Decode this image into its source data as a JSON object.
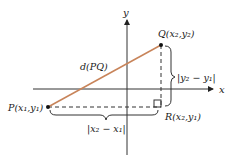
{
  "diagram": {
    "colors": {
      "segment": "#c8845a",
      "axes": "#222222",
      "background": "#ffffff"
    },
    "axes": {
      "x_label": "x",
      "y_label": "y"
    },
    "points": {
      "P": {
        "name": "P",
        "label": "P(x₁,y₁)"
      },
      "Q": {
        "name": "Q",
        "label": "Q(x₂,y₂)"
      },
      "R": {
        "name": "R",
        "label": "R(x₂,y₁)"
      }
    },
    "segment_label": "d(PQ)",
    "horizontal_brace_label": "|x₂ − x₁|",
    "vertical_brace_label": "|y₂ − y₁|"
  }
}
